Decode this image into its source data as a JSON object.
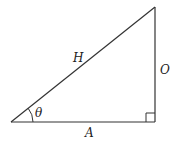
{
  "diagram": {
    "type": "right-triangle",
    "colors": {
      "stroke": "#333333",
      "label": "#222222",
      "background": "#ffffff"
    },
    "vertices": {
      "angle_vertex": [
        11,
        122
      ],
      "right_angle_vertex": [
        155,
        122
      ],
      "top_vertex": [
        155,
        7
      ]
    },
    "labels": {
      "hypotenuse": "H",
      "opposite": "O",
      "adjacent": "A",
      "angle": "θ"
    },
    "right_angle_marker": true
  }
}
